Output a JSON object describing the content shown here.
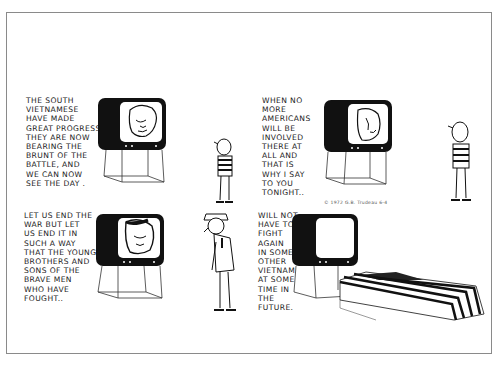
{
  "comic": {
    "type": "four-panel editorial comic strip",
    "panels": [
      {
        "index": 1,
        "caption": "The South\nVietnamese\nhave made\ngreat progress\nthey are now\nbearing the\nbrunt of the\nbattle, and\nwe can now\nsee the day .",
        "tv_screen": "president-face",
        "figure": "boy-striped-shirt"
      },
      {
        "index": 2,
        "caption": "When no\nmore\nAmericans\nwill be\ninvolved\nthere at\nall and\nthat is\nwhy I say\nto you\ntonight..",
        "tv_screen": "president-face",
        "figure": "boy-striped-shirt"
      },
      {
        "index": 3,
        "caption": "Let us end the\nwar but let\nus end it in\nsuch a way\nthat the younger\nbrothers and\nsons of the\nbrave men\nwho have\nfought..",
        "tv_screen": "president-face",
        "figure": "soldier-in-uniform"
      },
      {
        "index": 4,
        "caption": "will not\nhave to\nfight\nagain\nin some\nother\nVietnam\nat some\ntime in\nthe\nfuture.",
        "tv_screen": "blank",
        "figure": "flag-draped-coffin"
      }
    ],
    "signature": "© 1972 G.B. Trudeau 6-4",
    "colors": {
      "ink": "#111111",
      "paper": "#ffffff",
      "frame": "#8a8a8a"
    }
  }
}
